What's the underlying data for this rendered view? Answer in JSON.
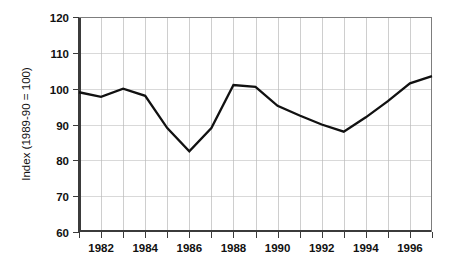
{
  "chart_data": {
    "type": "line",
    "title": "",
    "subtitle": "",
    "xlabel": "",
    "ylabel": "Index (1989-90 = 100)",
    "x": [
      1981,
      1982,
      1983,
      1984,
      1985,
      1986,
      1987,
      1988,
      1989,
      1990,
      1991,
      1992,
      1993,
      1994,
      1995,
      1996,
      1997
    ],
    "values": [
      99,
      97.7,
      100,
      98,
      89,
      82.5,
      89,
      101,
      100.5,
      95.2,
      92.5,
      90,
      88,
      92,
      96.5,
      101.5,
      103.5
    ],
    "series": [
      {
        "name": "Index",
        "color": "#111111",
        "values": [
          99,
          97.7,
          100,
          98,
          89,
          82.5,
          89,
          101,
          100.5,
          95.2,
          92.5,
          90,
          88,
          92,
          96.5,
          101.5,
          103.5
        ]
      }
    ],
    "xlim": [
      1981,
      1997
    ],
    "ylim": [
      60,
      120
    ],
    "yticks": [
      60,
      70,
      80,
      90,
      100,
      110,
      120
    ],
    "ytick_labels": [
      "60",
      "70",
      "80",
      "90",
      "100",
      "110",
      "120"
    ],
    "xticks": [
      1982,
      1984,
      1986,
      1988,
      1990,
      1992,
      1994,
      1996
    ],
    "xtick_labels": [
      "1982",
      "1984",
      "1986",
      "1988",
      "1990",
      "1992",
      "1994",
      "1996"
    ],
    "x_minor_ticks": [
      1981,
      1982,
      1983,
      1984,
      1985,
      1986,
      1987,
      1988,
      1989,
      1990,
      1991,
      1992,
      1993,
      1994,
      1995,
      1996,
      1997
    ],
    "grid": {
      "vertical": true,
      "horizontal": true,
      "vertical_at": [
        1982,
        1983,
        1984,
        1985,
        1986,
        1987,
        1988,
        1989,
        1990,
        1991,
        1992,
        1993,
        1994,
        1995,
        1996
      ],
      "horizontal_at": [
        70,
        80,
        90,
        100,
        110
      ]
    },
    "legend": {
      "visible": false,
      "position": "none",
      "entries": []
    },
    "annotations": [],
    "colors": {
      "line": "#111111",
      "grid": "#c0c0c0",
      "axis": "#3b3b3b",
      "background": "#ffffff",
      "text": "#111111"
    }
  }
}
